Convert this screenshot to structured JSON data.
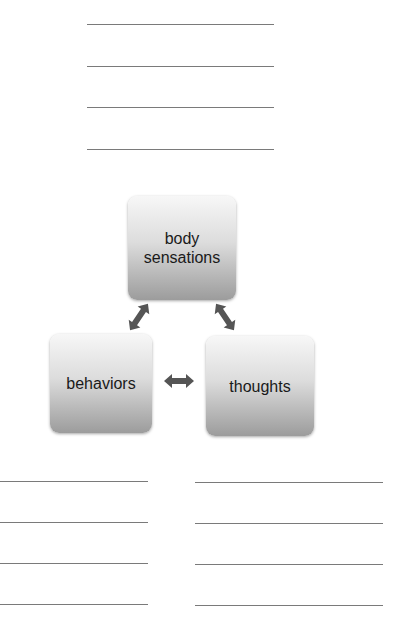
{
  "top_lines": {
    "count": 4
  },
  "diagram": {
    "nodes": [
      {
        "id": "body",
        "label_line1": "body",
        "label_line2": "sensations"
      },
      {
        "id": "behaviors",
        "label": "behaviors"
      },
      {
        "id": "thoughts",
        "label": "thoughts"
      }
    ],
    "edges": [
      {
        "from": "body",
        "to": "behaviors",
        "type": "bidirectional"
      },
      {
        "from": "body",
        "to": "thoughts",
        "type": "bidirectional"
      },
      {
        "from": "behaviors",
        "to": "thoughts",
        "type": "bidirectional"
      }
    ],
    "colors": {
      "box_top": "#f7f7f7",
      "box_bottom": "#9c9c9c",
      "arrow": "#555555",
      "text": "#1a1a1a"
    }
  },
  "bottom_lines": {
    "left_count": 4,
    "right_count": 4
  }
}
